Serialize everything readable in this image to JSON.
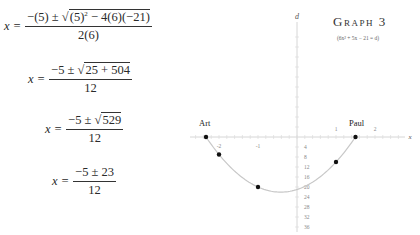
{
  "equations": {
    "eq1": {
      "lhs": "x =",
      "num_prefix": "−(5) ± √",
      "num_rad": "(5)",
      "num_sup": "2",
      "num_rest": " − 4(6)(−21)",
      "den": "2(6)"
    },
    "eq2": {
      "lhs": "x =",
      "num_prefix": "−5 ± √",
      "num_rad": "25 + 504",
      "den": "12"
    },
    "eq3": {
      "lhs": "x =",
      "num_prefix": "−5 ± √",
      "num_rad": "529",
      "den": "12"
    },
    "eq4": {
      "lhs": "x =",
      "num": "−5 ± 23",
      "den": "12"
    }
  },
  "graph": {
    "title": "Graph 3",
    "subtitle": "(6x² + 5x − 21 = d)",
    "point_labels": {
      "left": "Art",
      "right": "Paul"
    },
    "x_axis_label": "x",
    "d_axis_label": "d"
  },
  "chart_data": {
    "type": "line",
    "title": "Graph 3",
    "subtitle": "(6x² + 5x − 21 = d)",
    "xlabel": "x",
    "ylabel": "d",
    "equation": "d = 6x² + 5x − 21",
    "x_ticks": [
      -2,
      -1,
      1,
      2
    ],
    "d_ticks": [
      4,
      8,
      12,
      16,
      20,
      24,
      28,
      32,
      36,
      40
    ],
    "xlim": [
      -2.6,
      2.8
    ],
    "dlim": [
      -42,
      45
    ],
    "grid": false,
    "points": [
      {
        "label": "Art",
        "x": -2.333,
        "d": 0
      },
      {
        "label": "",
        "x": -2.0,
        "d": -7
      },
      {
        "label": "",
        "x": -1.0,
        "d": -20
      },
      {
        "label": "",
        "x": 1.0,
        "d": -10
      },
      {
        "label": "Paul",
        "x": 1.5,
        "d": 0
      }
    ],
    "roots": [
      -2.333,
      1.5
    ],
    "vertex": {
      "x": -0.417,
      "d": -22.04
    },
    "curve_color": "#c8c8c8",
    "point_color": "#111111"
  }
}
